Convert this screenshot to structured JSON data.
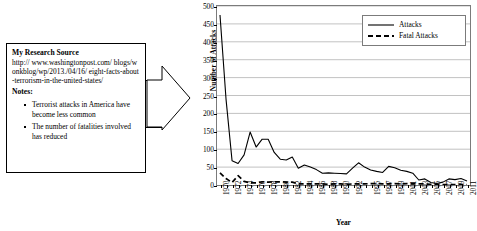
{
  "note_box": {
    "title": "My Research Source",
    "url": "http:// www.washingtonpost.com/ blogs/wonkblog/wp/2013./04/16/ eight-facts-about-terrorism-in-the-united-states/",
    "notes_heading": "Notes:",
    "notes": [
      "Terrorist attacks in America have become less common",
      "The number of fatalities involved has reduced"
    ]
  },
  "arrow": {
    "name": "block-arrow-right"
  },
  "chart_data": {
    "type": "line",
    "title": "",
    "xlabel": "Year",
    "ylabel": "Number of Attacks",
    "ylim": [
      0,
      500
    ],
    "yticks": [
      0,
      50,
      100,
      150,
      200,
      250,
      300,
      350,
      400,
      450,
      500
    ],
    "grid": true,
    "legend_position": "top-right",
    "x": [
      1970,
      1971,
      1972,
      1973,
      1974,
      1975,
      1976,
      1977,
      1978,
      1979,
      1980,
      1981,
      1982,
      1983,
      1984,
      1985,
      1986,
      1987,
      1988,
      1989,
      1990,
      1991,
      1992,
      1993,
      1994,
      1995,
      1996,
      1997,
      1998,
      1999,
      2000,
      2001,
      2002,
      2003,
      2004,
      2005,
      2006,
      2007,
      2008,
      2009,
      2010,
      2011
    ],
    "tick_labels": [
      "1970",
      "",
      "1972",
      "",
      "1974",
      "",
      "1976",
      "",
      "1978",
      "",
      "1980",
      "",
      "1982",
      "",
      "1984",
      "",
      "1986",
      "",
      "1988",
      "",
      "1990",
      "",
      "1992",
      "",
      "",
      "1995",
      "",
      "1997",
      "",
      "1999",
      "",
      "2001",
      "",
      "2003",
      "",
      "2005",
      "",
      "2007",
      "",
      "2009",
      "",
      "2011"
    ],
    "series": [
      {
        "name": "Attacks",
        "style": "solid",
        "values": [
          475,
          240,
          68,
          60,
          84,
          148,
          106,
          128,
          128,
          91,
          72,
          70,
          78,
          47,
          56,
          50,
          43,
          33,
          34,
          33,
          32,
          31,
          47,
          62,
          50,
          42,
          38,
          35,
          52,
          48,
          41,
          38,
          33,
          14,
          17,
          7,
          4,
          8,
          17,
          15,
          18,
          11
        ]
      },
      {
        "name": "Fatal Attacks",
        "style": "dashed",
        "values": [
          34,
          18,
          7,
          26,
          10,
          6,
          6,
          9,
          8,
          9,
          9,
          8,
          8,
          3,
          3,
          3,
          3,
          3,
          2,
          3,
          3,
          2,
          3,
          3,
          3,
          4,
          4,
          3,
          3,
          4,
          3,
          4,
          3,
          3,
          3,
          2,
          1,
          1,
          1,
          1,
          1,
          1
        ]
      }
    ]
  }
}
